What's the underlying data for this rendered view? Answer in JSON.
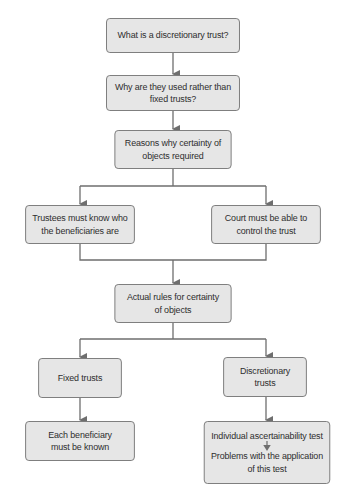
{
  "diagram": {
    "type": "flowchart",
    "colors": {
      "box_fill": "#e6e6e6",
      "box_border": "#7a7a7a",
      "line": "#6e6e6e",
      "text": "#2e2e2e",
      "background": "#ffffff"
    },
    "nodes": {
      "what_is": {
        "label": "What is a discretionary trust?"
      },
      "why_used": {
        "label": "Why are they used rather than fixed trusts?"
      },
      "reasons": {
        "label": "Reasons why certainty of objects required"
      },
      "trustees": {
        "label": "Trustees must know who the beneficiaries are"
      },
      "court": {
        "label": "Court must be able to control the trust"
      },
      "actual_rules": {
        "label": "Actual rules for certainty of objects"
      },
      "fixed": {
        "label": "Fixed trusts"
      },
      "discretionary": {
        "label": "Discretionary trusts"
      },
      "each_beneficiary": {
        "label": "Each beneficiary must be known"
      },
      "individual_test": {
        "label": "Individual ascertainability test"
      },
      "problems": {
        "label": "Problems with the application of this test"
      }
    },
    "edges": [
      [
        "what_is",
        "why_used"
      ],
      [
        "why_used",
        "reasons"
      ],
      [
        "reasons",
        "trustees"
      ],
      [
        "reasons",
        "court"
      ],
      [
        "trustees",
        "actual_rules"
      ],
      [
        "court",
        "actual_rules"
      ],
      [
        "actual_rules",
        "fixed"
      ],
      [
        "actual_rules",
        "discretionary"
      ],
      [
        "fixed",
        "each_beneficiary"
      ],
      [
        "discretionary",
        "individual_test"
      ],
      [
        "individual_test",
        "problems"
      ]
    ]
  },
  "lines": {
    "what_is": [
      "What is a discretionary trust?"
    ],
    "why_used": [
      "Why are they used rather than",
      "fixed trusts?"
    ],
    "reasons": [
      "Reasons why certainty of",
      "objects required"
    ],
    "trustees": [
      "Trustees must know who",
      "the beneficiaries are"
    ],
    "court": [
      "Court must be able to",
      "control the trust"
    ],
    "actual_rules": [
      "Actual rules for certainty",
      "of objects"
    ],
    "fixed": [
      "Fixed trusts"
    ],
    "discretionary": [
      "Discretionary",
      "trusts"
    ],
    "each_beneficiary": [
      "Each beneficiary",
      "must be known"
    ],
    "individual_test": [
      "Individual ascertainability test"
    ],
    "problems": [
      "Problems with the application",
      "of this test"
    ]
  }
}
